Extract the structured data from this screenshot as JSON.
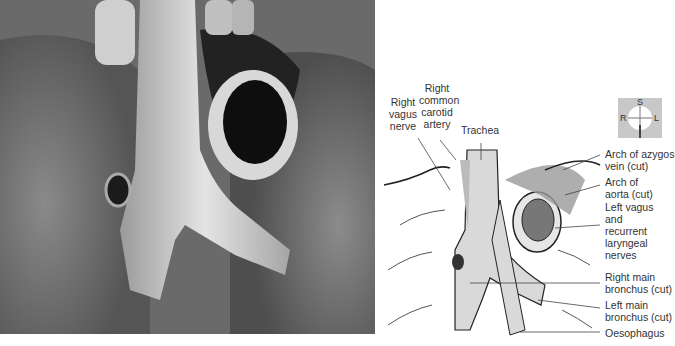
{
  "figure": {
    "photo": {
      "subject": "dissection-photo-trachea-bronchi",
      "tone": "grayscale"
    },
    "orientation": {
      "superior": "S",
      "inferior": "I",
      "right": "R",
      "left": "L",
      "bg": "#c8c8c8"
    },
    "labels_top": {
      "right_vagus": "Right vagus nerve",
      "right_common_carotid": "Right common carotid artery",
      "trachea": "Trachea"
    },
    "labels_right": [
      "Arch of azygos vein (cut)",
      "Arch of aorta (cut)",
      "Left vagus and recurrent laryngeal nerves",
      "Right main bronchus (cut)",
      "Left main bronchus (cut)",
      "Oesophagus"
    ],
    "colors": {
      "structure_fill": "#d9d9d9",
      "line": "#222222",
      "leader": "#444444"
    }
  }
}
